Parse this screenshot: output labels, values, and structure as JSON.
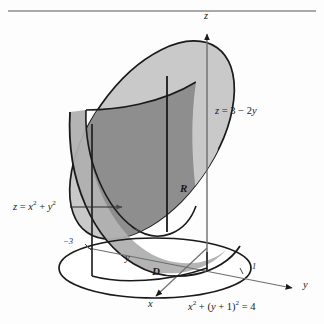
{
  "figure": {
    "kind": "3d-calculus-solid-diagram"
  },
  "axes": {
    "z_label": "z",
    "y_label": "y",
    "x_label": "x",
    "inner_y_label": "y"
  },
  "ticks": {
    "y_negative": "−3",
    "y_positive": "1"
  },
  "labels": {
    "plane_equation_lhs": "z",
    "plane_equation_rhs": "3 − 2y",
    "plane_equation_full": "z = 3 − 2y",
    "paraboloid_equation_full": "z = x² + y²",
    "paraboloid_lhs": "z",
    "paraboloid_base": "x",
    "region_solid": "R",
    "region_base": "D",
    "circle_equation_full": "x² + (y + 1)² = 4"
  },
  "colors": {
    "plane_fill": "#c9c9c9",
    "paraboloid_inner_fill": "#8e8e8e",
    "paraboloid_front_fill": "#b0b0b0",
    "outline": "#1a1a1a",
    "axis_line": "#6e6e6e",
    "top_rule": "#8c8c8c",
    "background": "#fdfdfd"
  }
}
